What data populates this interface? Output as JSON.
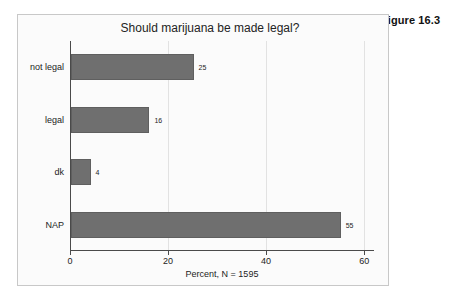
{
  "figure": {
    "label": "Figure 16.3"
  },
  "chart_data": {
    "type": "bar",
    "orientation": "horizontal",
    "title": "Should marijuana be made legal?",
    "xlabel": "Percent, N = 1595",
    "ylabel": "",
    "categories": [
      "not legal",
      "legal",
      "dk",
      "NAP"
    ],
    "values": [
      25,
      16,
      4,
      55
    ],
    "value_labels": [
      "25",
      "16",
      "4",
      "55"
    ],
    "xlim": [
      0,
      62
    ],
    "xticks": [
      0,
      20,
      40,
      60
    ],
    "xtick_labels": [
      "0",
      "20",
      "40",
      "60"
    ],
    "grid": "vertical",
    "legend": null,
    "bar_color": "#6f6f6f",
    "axis_color": "#4a4a4a",
    "grid_color": "#e2e2e2",
    "background": "#fbfbfb",
    "sample_size": 1595
  }
}
